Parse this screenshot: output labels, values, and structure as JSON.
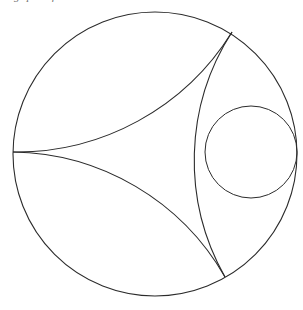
{
  "caption": {
    "visible_fragment": "g  p  n  f",
    "note": "cropped top caption line"
  },
  "figure": {
    "background_color": "#ffffff",
    "stroke_color": "#2b2b2b",
    "stroke_width": 1.1
  },
  "chart_data": {
    "type": "diagram",
    "xlabel": "",
    "ylabel": "",
    "grid": false,
    "legend": false,
    "xlim": [
      0,
      303
    ],
    "ylim": [
      0,
      310
    ],
    "boundary_circle": {
      "name": "boundary-circle",
      "cx": 155,
      "cy": 154,
      "r": 142
    },
    "inscribed_circle": {
      "name": "inscribed-circle",
      "cx": 251,
      "cy": 152,
      "r": 46
    },
    "ideal_vertices": [
      {
        "name": "vertex-left",
        "x": 13,
        "y": 152
      },
      {
        "name": "vertex-upper-right",
        "x": 232,
        "y": 32
      },
      {
        "name": "vertex-lower-right",
        "x": 225,
        "y": 277
      }
    ],
    "geodesic_sides": [
      {
        "name": "side-upper",
        "from": "vertex-left",
        "to": "vertex-upper-right",
        "arc_sweep": "bulge-up-left",
        "path": "M 13 152 Q 120 132 232 32"
      },
      {
        "name": "side-lower",
        "from": "vertex-left",
        "to": "vertex-lower-right",
        "arc_sweep": "bulge-down-left",
        "path": "M 13 152 Q 118 170 225 277"
      },
      {
        "name": "side-right",
        "from": "vertex-upper-right",
        "to": "vertex-lower-right",
        "arc_sweep": "bulge-left",
        "path": "M 232 32 Q 184 152 225 277"
      }
    ],
    "tangency_points": [
      {
        "name": "tangency-side-right",
        "x": 205,
        "y": 152
      },
      {
        "name": "tangency-boundary-right",
        "x": 297,
        "y": 152
      }
    ]
  }
}
